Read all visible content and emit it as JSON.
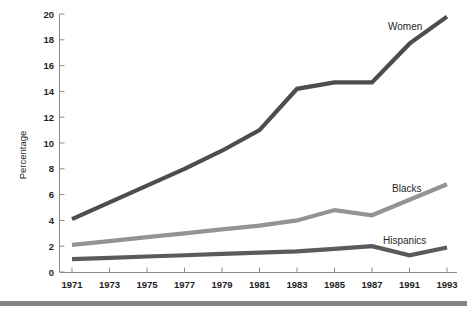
{
  "chart_data": {
    "type": "line",
    "title": "",
    "subtitle": "",
    "xlabel": "",
    "ylabel": "Percentage",
    "x": [
      1971,
      1973,
      1975,
      1977,
      1979,
      1981,
      1983,
      1985,
      1987,
      1991,
      1993
    ],
    "xtick_labels": [
      "1971",
      "1973",
      "1975",
      "1977",
      "1979",
      "1981",
      "1983",
      "1985",
      "1987",
      "1991",
      "1993"
    ],
    "ytick_labels": [
      "0",
      "2",
      "4",
      "6",
      "8",
      "10",
      "12",
      "14",
      "16",
      "18",
      "20"
    ],
    "yticks": [
      0,
      2,
      4,
      6,
      8,
      10,
      12,
      14,
      16,
      18,
      20
    ],
    "ylim": [
      0,
      20
    ],
    "grid": false,
    "legend_position": "inline-right-of-series",
    "series": [
      {
        "name": "Women",
        "color": "#4d4d4d",
        "label": "Women",
        "values": [
          4.1,
          5.4,
          6.7,
          8.0,
          9.4,
          11.0,
          14.2,
          14.7,
          14.7,
          17.7,
          19.8
        ]
      },
      {
        "name": "Blacks",
        "color": "#939393",
        "label": "Blacks",
        "values": [
          2.1,
          2.4,
          2.7,
          3.0,
          3.3,
          3.6,
          4.0,
          4.8,
          4.4,
          5.6,
          6.8
        ]
      },
      {
        "name": "Hispanics",
        "color": "#5a5a5a",
        "label": "Hispanics",
        "values": [
          1.0,
          1.1,
          1.2,
          1.3,
          1.4,
          1.5,
          1.6,
          1.8,
          2.0,
          1.3,
          1.9
        ]
      }
    ],
    "annotations": []
  },
  "axes": {
    "y_title": "Percentage"
  },
  "footer": {
    "rule_color": "#848484"
  }
}
